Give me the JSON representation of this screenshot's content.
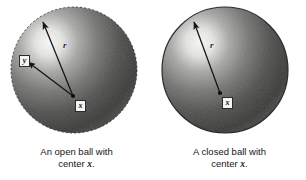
{
  "figure": {
    "background_color": "#ffffff",
    "panels": [
      {
        "id": "open-ball",
        "caption_line1": "An open ball with",
        "caption_line2_prefix": "center ",
        "caption_line2_symbol": "x",
        "caption_line2_suffix": ".",
        "center_label": "x",
        "radius_label": "r",
        "point_label": "y",
        "boundary_style": "open",
        "sphere_dark_color": "#3d3d3d",
        "sphere_mid_color": "#6e6e6e",
        "sphere_highlight_color": "#f2f2f0",
        "arrow_color": "#1a1a1a"
      },
      {
        "id": "closed-ball",
        "caption_line1": "A closed ball with",
        "caption_line2_prefix": "center ",
        "caption_line2_symbol": "x",
        "caption_line2_suffix": ".",
        "center_label": "x",
        "radius_label": "r",
        "point_label": "",
        "boundary_style": "closed",
        "sphere_dark_color": "#3d3d3d",
        "sphere_mid_color": "#6e6e6e",
        "sphere_highlight_color": "#f2f2f0",
        "arrow_color": "#1a1a1a"
      }
    ]
  }
}
